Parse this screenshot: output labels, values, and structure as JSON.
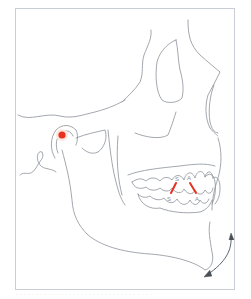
{
  "figure": {
    "colors": {
      "line": "#8c9098",
      "frame": "#c9ced6",
      "accent": "#e8321e"
    },
    "markers": {
      "condyle_point": "condyle-dot",
      "tooth_marks": [
        {
          "upper_label": "S",
          "lower_label": "S"
        },
        {
          "upper_label": "A",
          "lower_label": "A"
        }
      ]
    },
    "motion_arrow": "curved-double-arrow"
  },
  "caption": "· · · · · · · · · · · · · · · · · · · · · · · · · · · · · · · · · ·"
}
